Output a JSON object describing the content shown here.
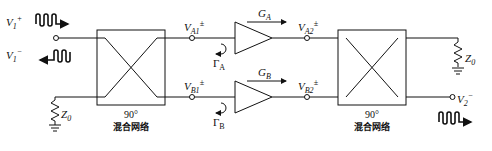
{
  "diagram": {
    "ports": {
      "v1_plus": {
        "sym": "V",
        "sub": "1",
        "sup": "+"
      },
      "v1_minus": {
        "sym": "V",
        "sub": "1",
        "sup": "−"
      },
      "v2_minus": {
        "sym": "V",
        "sub": "2",
        "sup": "−"
      }
    },
    "nodes": {
      "va1": {
        "sym": "V",
        "sub": "A1",
        "sup": "±"
      },
      "va2": {
        "sym": "V",
        "sub": "A2",
        "sup": "±"
      },
      "vb1": {
        "sym": "V",
        "sub": "B1",
        "sup": "±"
      },
      "vb2": {
        "sym": "V",
        "sub": "B2",
        "sup": "±"
      }
    },
    "gains": {
      "ga": {
        "sym": "G",
        "sub": "A"
      },
      "gb": {
        "sym": "G",
        "sub": "B"
      }
    },
    "reflections": {
      "gamma_a": {
        "sym": "Γ",
        "sub": "A"
      },
      "gamma_b": {
        "sym": "Γ",
        "sub": "B"
      }
    },
    "loads": {
      "z0_left": {
        "sym": "Z",
        "sub": "0"
      },
      "z0_right": {
        "sym": "Z",
        "sub": "0"
      }
    },
    "hybrids": [
      {
        "angle": "90°",
        "name": "混合网络"
      },
      {
        "angle": "90°",
        "name": "混合网络"
      }
    ]
  }
}
